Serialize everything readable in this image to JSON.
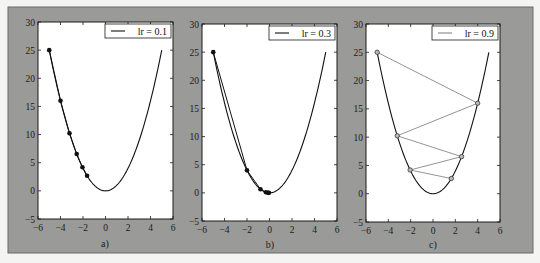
{
  "figure": {
    "background_color": "#9a9a98",
    "panel_color": "#ffffff"
  },
  "chart_data": [
    {
      "type": "line",
      "panel_label": "a)",
      "legend": "lr = 0.1",
      "curve": "y = x^2",
      "xlim": [
        -6,
        6
      ],
      "ylim": [
        -5,
        30
      ],
      "xticks": [
        -6,
        -4,
        -2,
        0,
        2,
        4,
        6
      ],
      "yticks": [
        -5,
        0,
        5,
        10,
        15,
        20,
        25,
        30
      ],
      "series": [
        {
          "name": "gradient descent steps",
          "marker": "filled-circle",
          "color": "#111111",
          "connect": true,
          "x": [
            -5,
            -4,
            -3.2,
            -2.56,
            -2.048,
            -1.6384
          ],
          "y": [
            25,
            16,
            10.24,
            6.5536,
            4.1943,
            2.6844
          ]
        }
      ]
    },
    {
      "type": "line",
      "panel_label": "b)",
      "legend": "lr = 0.3",
      "curve": "y = x^2",
      "xlim": [
        -6,
        6
      ],
      "ylim": [
        -5,
        30
      ],
      "xticks": [
        -6,
        -4,
        -2,
        0,
        2,
        4,
        6
      ],
      "yticks": [
        -5,
        0,
        5,
        10,
        15,
        20,
        25,
        30
      ],
      "series": [
        {
          "name": "gradient descent steps",
          "marker": "filled-circle",
          "color": "#111111",
          "connect": true,
          "x": [
            -5,
            -2,
            -0.8,
            -0.32,
            -0.128,
            -0.0512
          ],
          "y": [
            25,
            4,
            0.64,
            0.1024,
            0.0164,
            0.0026
          ]
        }
      ]
    },
    {
      "type": "line",
      "panel_label": "c)",
      "legend": "lr = 0.9",
      "curve": "y = x^2",
      "xlim": [
        -6,
        6
      ],
      "ylim": [
        -5,
        30
      ],
      "xticks": [
        -6,
        -4,
        -2,
        0,
        2,
        4,
        6
      ],
      "yticks": [
        -5,
        0,
        5,
        10,
        15,
        20,
        25,
        30
      ],
      "series": [
        {
          "name": "gradient descent steps",
          "marker": "hollow-circle",
          "color": "#888888",
          "connect": true,
          "x": [
            -5,
            4,
            -3.2,
            2.56,
            -2.048,
            1.6384
          ],
          "y": [
            25,
            16,
            10.24,
            6.5536,
            4.1943,
            2.6844
          ]
        }
      ]
    }
  ],
  "panels_px": [
    {
      "left": 38,
      "right": 173,
      "top": 22,
      "bottom": 219,
      "caption_x": 105,
      "caption_y": 247
    },
    {
      "left": 202,
      "right": 337,
      "top": 24,
      "bottom": 221,
      "caption_x": 270,
      "caption_y": 248
    },
    {
      "left": 366,
      "right": 500,
      "top": 24,
      "bottom": 222,
      "caption_x": 433,
      "caption_y": 248
    }
  ]
}
